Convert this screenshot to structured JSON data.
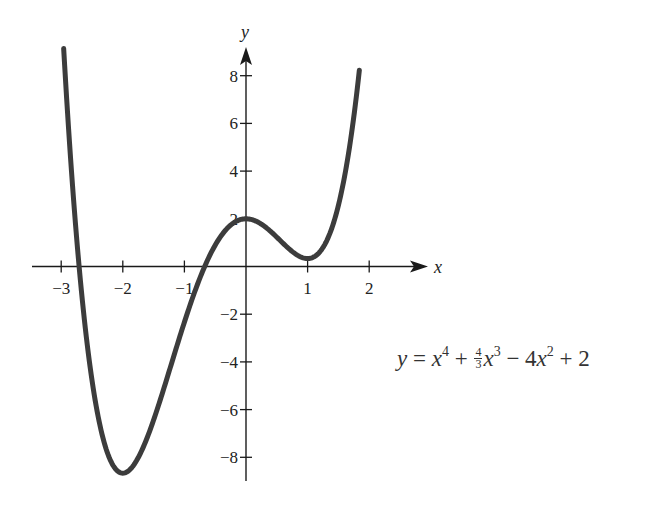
{
  "chart_data": {
    "type": "line",
    "title": "",
    "function": "y = x^4 + (4/3)x^3 - 4x^2 + 2",
    "xlabel": "x",
    "ylabel": "y",
    "xlim": [
      -3.1,
      2.9
    ],
    "ylim": [
      -9,
      9.5
    ],
    "grid": false,
    "x_ticks": [
      -3,
      -2,
      -1,
      1,
      2
    ],
    "x_tick_labels": [
      "−3",
      "−2",
      "−1",
      "1",
      "2"
    ],
    "y_ticks": [
      8,
      6,
      4,
      2,
      -2,
      -4,
      -6,
      -8
    ],
    "y_tick_labels": [
      "8",
      "6",
      "4",
      "2",
      "−2",
      "−4",
      "−6",
      "−8"
    ],
    "series": [
      {
        "name": "y = x^4 + 4/3 x^3 - 4x^2 + 2",
        "x": [
          -2.96,
          -2.75,
          -2.5,
          -2.25,
          -2.0,
          -1.75,
          -1.5,
          -1.25,
          -1.0,
          -0.75,
          -0.5,
          -0.25,
          0,
          0.25,
          0.5,
          0.75,
          1.0,
          1.25,
          1.5,
          1.75,
          1.84
        ],
        "values": [
          9.0,
          -0.16,
          -5.27,
          -7.82,
          -8.67,
          -8.31,
          -7.44,
          -6.26,
          -3.33,
          -1.41,
          1.06,
          1.73,
          2.0,
          1.77,
          1.23,
          0.62,
          0.33,
          1.06,
          4.06,
          9.21,
          9.0
        ]
      }
    ],
    "annotations": [
      {
        "text": "y = x⁴ + ⁴⁄₃x³ − 4x² + 2",
        "position": "right-middle"
      }
    ],
    "extrema": {
      "local_max": [
        0,
        2
      ],
      "local_min": [
        [
          -2,
          -8.67
        ],
        [
          1,
          0.33
        ]
      ]
    }
  },
  "axes": {
    "x_label": "x",
    "y_label": "y"
  },
  "equation": {
    "y": "y",
    "eq": " = ",
    "x1": "x",
    "p4": "4",
    "plus1": " + ",
    "num": "4",
    "den": "3",
    "x2": "x",
    "p3": "3",
    "minus": " − 4",
    "x3": "x",
    "p2": "2",
    "plus2": " + 2"
  },
  "style": {
    "curve_color": "#3c3c3c",
    "axis_color": "#1a1a1a"
  }
}
